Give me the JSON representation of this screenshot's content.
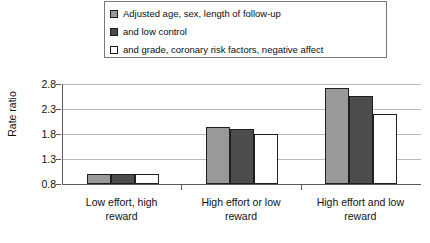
{
  "chart_data": {
    "type": "bar",
    "title": "",
    "xlabel": "",
    "ylabel": "Rate ratio",
    "ylim": [
      0.8,
      2.8
    ],
    "yticks": [
      0.8,
      1.3,
      1.8,
      2.3,
      2.8
    ],
    "ytick_labels": [
      "0.8",
      "1.3",
      "1.8",
      "2.3",
      "2.8"
    ],
    "grid": true,
    "legend_position": "top",
    "categories": [
      "Low effort, high reward",
      "High effort or low reward",
      "High effort and low reward"
    ],
    "category_lines": [
      [
        "Low effort, high",
        "reward"
      ],
      [
        "High effort or low",
        "reward"
      ],
      [
        "High effort and low",
        "reward"
      ]
    ],
    "series": [
      {
        "name": "Adjusted age, sex, length of follow-up",
        "color": "#999999",
        "values": [
          1.0,
          1.95,
          2.72
        ]
      },
      {
        "name": "and low control",
        "color": "#4d4d4d",
        "values": [
          1.0,
          1.9,
          2.56
        ]
      },
      {
        "name": "and grade, coronary risk factors, negative affect",
        "color": "#ffffff",
        "values": [
          1.0,
          1.8,
          2.2
        ]
      }
    ]
  },
  "legend": {
    "items": [
      {
        "label": "Adjusted age, sex, length of follow-up",
        "color": "#999999"
      },
      {
        "label": "and low control",
        "color": "#4d4d4d"
      },
      {
        "label": "and grade, coronary risk factors, negative affect",
        "color": "#ffffff"
      }
    ]
  },
  "axis": {
    "y_label": "Rate ratio",
    "y_ticks": [
      "2.8",
      "2.3",
      "1.8",
      "1.3",
      "0.8"
    ]
  },
  "colors": {
    "series_light": "#999999",
    "series_dark": "#4d4d4d",
    "series_white": "#ffffff",
    "grid": "#b9b9b9",
    "axis": "#5a5a5a",
    "bar_border": "#1f1f1f"
  }
}
